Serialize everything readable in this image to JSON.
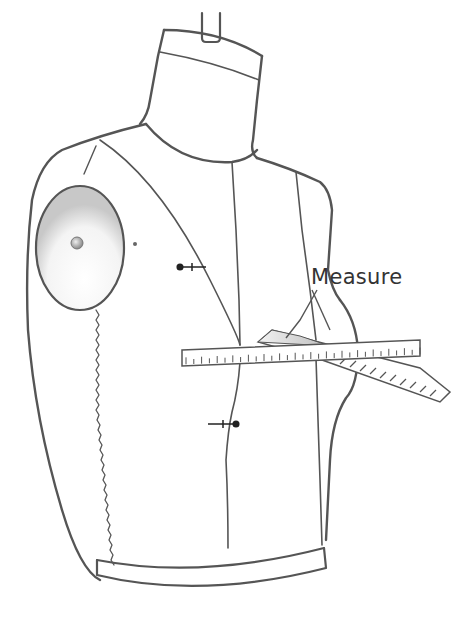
{
  "diagram": {
    "annotation": {
      "label": "Measure",
      "pointer_count": 2
    },
    "parts": [
      "neck-stand-pole",
      "neck",
      "torso",
      "shoulder-cap",
      "armhole-seam",
      "princess-seams",
      "center-front-seam",
      "pins",
      "waistband",
      "ruler",
      "tape-measure"
    ],
    "colors": {
      "outline": "#555555",
      "label": "#333333",
      "tape_fill": "#d8d8d8",
      "background": "#ffffff"
    }
  }
}
